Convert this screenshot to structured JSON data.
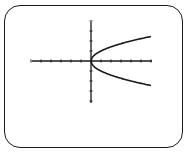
{
  "chart_data": {
    "type": "line",
    "title": "",
    "xlabel": "",
    "ylabel": "",
    "equation": "x = y^2 (y = ±√x)",
    "xlim": [
      -6,
      6
    ],
    "ylim": [
      -4,
      4
    ],
    "x_tick_step": 1,
    "y_tick_step": 1,
    "grid": false,
    "legend": null,
    "series": [
      {
        "name": "upper branch y = √x",
        "x": [
          0,
          0.25,
          1,
          2,
          3,
          4,
          5,
          6
        ],
        "y": [
          0,
          0.5,
          1,
          1.41,
          1.73,
          2,
          2.24,
          2.45
        ]
      },
      {
        "name": "lower branch y = -√x",
        "x": [
          0,
          0.25,
          1,
          2,
          3,
          4,
          5,
          6
        ],
        "y": [
          0,
          -0.5,
          -1,
          -1.41,
          -1.73,
          -2,
          -2.24,
          -2.45
        ]
      }
    ]
  },
  "colors": {
    "frame": "#1a1a1a",
    "axes": "#1a1a1a",
    "curve": "#1a1a1a",
    "background": "#ffffff"
  },
  "plot_layout": {
    "origin_px": [
      91,
      61
    ],
    "unit_px": 10,
    "x_axis_px": [
      32,
      152
    ],
    "y_axis_px": [
      22,
      103
    ]
  }
}
